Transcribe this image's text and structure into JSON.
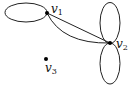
{
  "graph": {
    "vertices": [
      {
        "id": "v1",
        "label": "v",
        "sub": "1",
        "x": 47,
        "y": 13
      },
      {
        "id": "v2",
        "label": "v",
        "sub": "2",
        "x": 110,
        "y": 43
      },
      {
        "id": "v3",
        "label": "v",
        "sub": "3",
        "x": 46,
        "y": 59
      }
    ],
    "edges": [
      {
        "from": "v1",
        "to": "v1",
        "type": "loop",
        "direction": "left"
      },
      {
        "from": "v1",
        "to": "v2",
        "type": "straight"
      },
      {
        "from": "v1",
        "to": "v2",
        "type": "curved"
      },
      {
        "from": "v2",
        "to": "v2",
        "type": "loop",
        "direction": "up"
      },
      {
        "from": "v2",
        "to": "v2",
        "type": "loop",
        "direction": "down"
      }
    ]
  },
  "colors": {
    "edge": "#222222",
    "vertex": "#000000",
    "background": "#ffffff"
  }
}
